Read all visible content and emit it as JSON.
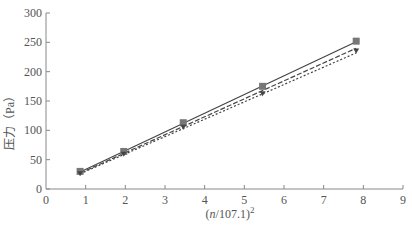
{
  "chart_data": {
    "type": "line",
    "title": "",
    "xlabel": "(n/107.1)²",
    "ylabel": "压力（Pa）",
    "xlim": [
      0,
      9
    ],
    "ylim": [
      0,
      300
    ],
    "x_ticks": [
      0,
      1,
      2,
      3,
      4,
      5,
      6,
      7,
      8,
      9
    ],
    "y_ticks": [
      0,
      50,
      100,
      150,
      200,
      250,
      300
    ],
    "grid": false,
    "legend": "none",
    "series": [
      {
        "name": "measured-square",
        "marker": "square",
        "line": "solid",
        "x": [
          0.86,
          1.96,
          3.46,
          5.46,
          7.82
        ],
        "y": [
          30,
          64,
          113,
          175,
          252
        ]
      },
      {
        "name": "measured-triangle",
        "marker": "triangle",
        "line": "dashed",
        "x": [
          0.86,
          1.96,
          3.46,
          5.46,
          7.82
        ],
        "y": [
          27,
          60,
          106,
          163,
          236
        ]
      },
      {
        "name": "fit-dotted",
        "marker": "none",
        "line": "dotted",
        "x": [
          0.86,
          7.82
        ],
        "y": [
          26,
          232
        ]
      }
    ],
    "fit_lines": [
      {
        "style": "solid",
        "x": [
          0.86,
          7.82
        ],
        "y": [
          29,
          251
        ]
      },
      {
        "style": "dashed",
        "x": [
          0.86,
          7.82
        ],
        "y": [
          27,
          240
        ]
      },
      {
        "style": "dotted",
        "x": [
          0.86,
          7.82
        ],
        "y": [
          26,
          232
        ]
      }
    ]
  },
  "labels": {
    "xlabel_prefix": "(",
    "xlabel_var": "n",
    "xlabel_mid": "/107.1)",
    "xlabel_sup": "2",
    "ylabel": "压力（Pa）"
  },
  "style": {
    "axis_color": "#888888",
    "text_color": "#555555",
    "marker_color": "#777777",
    "line_color": "#444444"
  }
}
